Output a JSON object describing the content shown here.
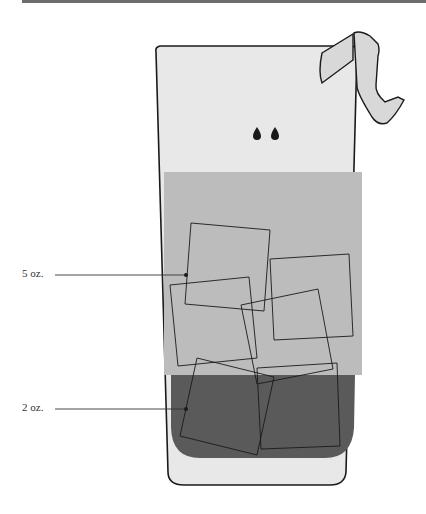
{
  "diagram": {
    "labels": [
      {
        "id": "top-layer",
        "text": "5 oz."
      },
      {
        "id": "bottom-layer",
        "text": "2 oz."
      }
    ],
    "colors": {
      "glass": "#e8e8e8",
      "top_liquid": "#bcbcbc",
      "bottom_liquid": "#5a5a5a",
      "outline": "#1a1a1a",
      "garnish": "#d8d8d8",
      "top_bar": "#6d6d6d"
    },
    "elements": [
      "glass",
      "lemon-twist-garnish",
      "two-drops",
      "ice-cubes",
      "top-liquid-layer",
      "bottom-liquid-layer"
    ]
  }
}
